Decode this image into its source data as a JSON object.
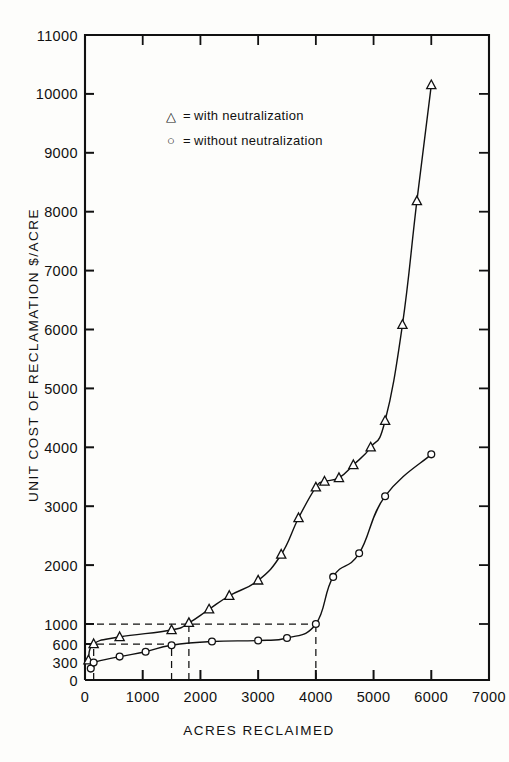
{
  "chart_data": {
    "type": "line",
    "title": "",
    "xlabel": "ACRES RECLAIMED",
    "ylabel": "UNIT COST OF RECLAMATION $/ACRE",
    "xlim": [
      0,
      7000
    ],
    "ylim": [
      0,
      11000
    ],
    "grid": false,
    "legend_position": "upper-left-inside",
    "xticks": [
      0,
      1000,
      2000,
      3000,
      4000,
      5000,
      6000,
      7000
    ],
    "xticklabels": [
      "0",
      "1000",
      "2000",
      "3000",
      "4000",
      "5000",
      "6000",
      "7000"
    ],
    "yticks": [
      0,
      300,
      600,
      1000,
      2000,
      3000,
      4000,
      5000,
      6000,
      7000,
      8000,
      9000,
      10000,
      11000
    ],
    "yticklabels": [
      "0",
      "300",
      "600",
      "1000",
      "2000",
      "3000",
      "4000",
      "5000",
      "6000",
      "7000",
      "8000",
      "9000",
      "10000",
      "11000"
    ],
    "series": [
      {
        "name": "with neutralization",
        "marker": "triangle",
        "legend_symbol": "△",
        "points": [
          {
            "x": 60,
            "y": 330
          },
          {
            "x": 150,
            "y": 600
          },
          {
            "x": 600,
            "y": 740
          },
          {
            "x": 1500,
            "y": 880
          },
          {
            "x": 1800,
            "y": 1020
          },
          {
            "x": 2150,
            "y": 1250
          },
          {
            "x": 2500,
            "y": 1480
          },
          {
            "x": 3000,
            "y": 1740
          },
          {
            "x": 3400,
            "y": 2180
          },
          {
            "x": 3700,
            "y": 2800
          },
          {
            "x": 4000,
            "y": 3320
          },
          {
            "x": 4150,
            "y": 3420
          },
          {
            "x": 4400,
            "y": 3480
          },
          {
            "x": 4650,
            "y": 3700
          },
          {
            "x": 4950,
            "y": 4000
          },
          {
            "x": 5200,
            "y": 4450
          },
          {
            "x": 5500,
            "y": 6080
          },
          {
            "x": 5750,
            "y": 8180
          },
          {
            "x": 6000,
            "y": 10150
          }
        ]
      },
      {
        "name": "without neutralization",
        "marker": "circle",
        "legend_symbol": "○",
        "points": [
          {
            "x": 100,
            "y": 190
          },
          {
            "x": 150,
            "y": 290
          },
          {
            "x": 600,
            "y": 390
          },
          {
            "x": 1050,
            "y": 470
          },
          {
            "x": 1500,
            "y": 580
          },
          {
            "x": 2200,
            "y": 650
          },
          {
            "x": 3000,
            "y": 670
          },
          {
            "x": 3500,
            "y": 720
          },
          {
            "x": 4000,
            "y": 1000
          },
          {
            "x": 4300,
            "y": 1800
          },
          {
            "x": 4750,
            "y": 2200
          },
          {
            "x": 5200,
            "y": 3170
          },
          {
            "x": 6000,
            "y": 3880
          }
        ]
      }
    ],
    "reference_lines": [
      {
        "orientation": "horizontal",
        "value": 1000,
        "from_x": 0,
        "to_x": 4000,
        "style": "dashed"
      },
      {
        "orientation": "horizontal",
        "value": 600,
        "from_x": 0,
        "to_x": 1500,
        "style": "dashed"
      },
      {
        "orientation": "vertical",
        "value": 150,
        "from_y": 0,
        "to_y": 600,
        "style": "dashed"
      },
      {
        "orientation": "vertical",
        "value": 1500,
        "from_y": 0,
        "to_y": 600,
        "style": "dashed"
      },
      {
        "orientation": "vertical",
        "value": 1800,
        "from_y": 0,
        "to_y": 1000,
        "style": "dashed"
      },
      {
        "orientation": "vertical",
        "value": 4000,
        "from_y": 0,
        "to_y": 1000,
        "style": "dashed"
      }
    ],
    "legend": [
      {
        "symbol": "△",
        "equals": "=",
        "label": "with  neutralization"
      },
      {
        "symbol": "○",
        "equals": "=",
        "label": "without  neutralization"
      }
    ]
  },
  "colors": {
    "ink": "#111111",
    "paper": "#fdfdfb",
    "marker_fill": "#ffffff"
  }
}
